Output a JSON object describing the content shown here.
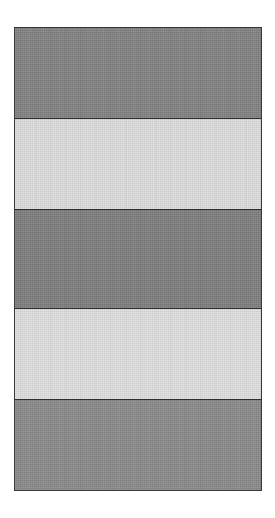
{
  "figure": {
    "canvas": {
      "width_px": 275,
      "height_px": 518,
      "background_color": "#ffffff"
    },
    "frame": {
      "left_px": 14,
      "top_px": 27,
      "width_px": 248,
      "height_px": 464,
      "border_color": "#3a3a3a",
      "border_width_px": 1.5
    },
    "separator": {
      "color": "#2d2d2d",
      "width_px": 1.2
    },
    "bands": [
      {
        "index": 1,
        "tone": "dark",
        "color": "#828282",
        "height_px": 90,
        "top_px": 27,
        "bottom_px": 117,
        "label": ""
      },
      {
        "index": 2,
        "tone": "light",
        "color": "#dedede",
        "height_px": 91,
        "top_px": 117,
        "bottom_px": 208,
        "label": ""
      },
      {
        "index": 3,
        "tone": "dark",
        "color": "#7e7e7e",
        "height_px": 99,
        "top_px": 208,
        "bottom_px": 307,
        "label": ""
      },
      {
        "index": 4,
        "tone": "light",
        "color": "#e0e0e0",
        "height_px": 91,
        "top_px": 307,
        "bottom_px": 398,
        "label": ""
      },
      {
        "index": 5,
        "tone": "dark",
        "color": "#8a8a8a",
        "height_px": 93,
        "top_px": 398,
        "bottom_px": 491,
        "label": ""
      }
    ]
  }
}
